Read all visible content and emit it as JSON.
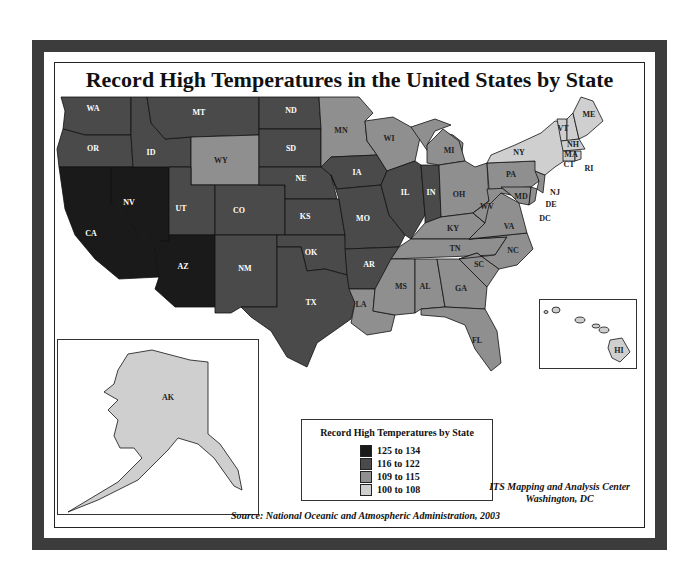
{
  "title": "Record High Temperatures in the United States by State",
  "legend": {
    "title": "Record High Temperatures by State",
    "items": [
      {
        "label": "125 to 134",
        "color": "#1a1a1a"
      },
      {
        "label": "116 to 122",
        "color": "#4a4a4a"
      },
      {
        "label": "109 to 115",
        "color": "#8f8f8f"
      },
      {
        "label": "100 to 108",
        "color": "#cfcfcf"
      }
    ]
  },
  "credit": {
    "line1": "ITS Mapping and Analysis Center",
    "line2": "Washington, DC"
  },
  "source": "Source: National Oceanic and Atmospheric Administration, 2003",
  "states": {
    "WA": "116 to 122",
    "OR": "116 to 122",
    "CA": "125 to 134",
    "NV": "125 to 134",
    "ID": "116 to 122",
    "MT": "116 to 122",
    "WY": "109 to 115",
    "UT": "116 to 122",
    "AZ": "125 to 134",
    "CO": "116 to 122",
    "NM": "116 to 122",
    "ND": "116 to 122",
    "SD": "116 to 122",
    "NE": "116 to 122",
    "KS": "116 to 122",
    "OK": "116 to 122",
    "TX": "116 to 122",
    "MN": "109 to 115",
    "IA": "116 to 122",
    "MO": "116 to 122",
    "AR": "116 to 122",
    "LA": "109 to 115",
    "WI": "109 to 115",
    "IL": "116 to 122",
    "IN": "116 to 122",
    "MI": "109 to 115",
    "OH": "109 to 115",
    "KY": "109 to 115",
    "TN": "109 to 115",
    "MS": "109 to 115",
    "AL": "109 to 115",
    "GA": "109 to 115",
    "FL": "109 to 115",
    "SC": "109 to 115",
    "NC": "109 to 115",
    "VA": "109 to 115",
    "WV": "109 to 115",
    "PA": "109 to 115",
    "NY": "100 to 108",
    "VT": "100 to 108",
    "NH": "100 to 108",
    "ME": "100 to 108",
    "MA": "100 to 108",
    "CT": "100 to 108",
    "RI": "100 to 108",
    "NJ": "109 to 115",
    "DE": "109 to 115",
    "MD": "109 to 115",
    "DC": "109 to 115",
    "AK": "100 to 108",
    "HI": "100 to 108"
  },
  "labels": {
    "WA": "WA",
    "OR": "OR",
    "CA": "CA",
    "NV": "NV",
    "ID": "ID",
    "MT": "MT",
    "WY": "WY",
    "UT": "UT",
    "AZ": "AZ",
    "CO": "CO",
    "NM": "NM",
    "ND": "ND",
    "SD": "SD",
    "NE": "NE",
    "KS": "KS",
    "OK": "OK",
    "TX": "TX",
    "MN": "MN",
    "IA": "IA",
    "MO": "MO",
    "AR": "AR",
    "LA": "LA",
    "WI": "WI",
    "IL": "IL",
    "IN": "IN",
    "MI": "MI",
    "OH": "OH",
    "KY": "KY",
    "TN": "TN",
    "MS": "MS",
    "AL": "AL",
    "GA": "GA",
    "FL": "FL",
    "SC": "SC",
    "NC": "NC",
    "VA": "VA",
    "WV": "WV",
    "PA": "PA",
    "NY": "NY",
    "VT": "VT",
    "NH": "NH",
    "ME": "ME",
    "MA": "MA",
    "CT": "CT",
    "RI": "RI",
    "NJ": "NJ",
    "DE": "DE",
    "MD": "MD",
    "DC": "DC",
    "AK": "AK",
    "HI": "HI"
  }
}
